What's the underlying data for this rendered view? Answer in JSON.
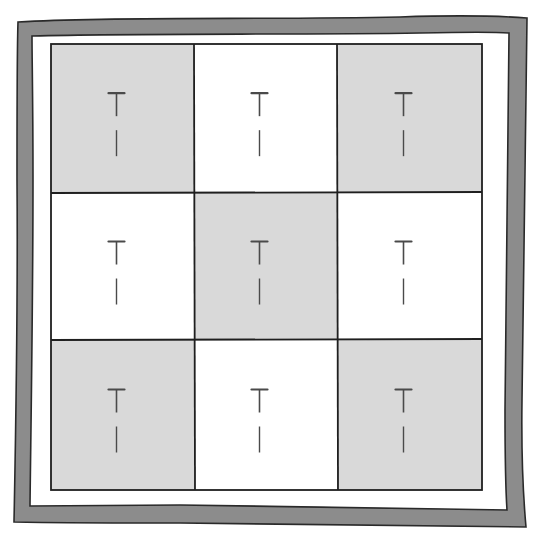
{
  "illustration": {
    "subject": "Framed 3x3 checkerboard of squares, each with a T-pin",
    "colors": {
      "background": "#ffffff",
      "frame_fill": "#8c8c8c",
      "frame_stroke": "#2a2a2a",
      "shaded_square": "#d9d9d9",
      "white_square": "#ffffff",
      "grid_line": "#1f1f1f",
      "pin": "#4a4a4a"
    },
    "grid": {
      "rows": 3,
      "cols": 3,
      "cells": [
        {
          "row": 0,
          "col": 0,
          "shade": "shaded",
          "has_pin": true
        },
        {
          "row": 0,
          "col": 1,
          "shade": "white",
          "has_pin": true
        },
        {
          "row": 0,
          "col": 2,
          "shade": "shaded",
          "has_pin": true
        },
        {
          "row": 1,
          "col": 0,
          "shade": "white",
          "has_pin": true
        },
        {
          "row": 1,
          "col": 1,
          "shade": "shaded",
          "has_pin": true
        },
        {
          "row": 1,
          "col": 2,
          "shade": "white",
          "has_pin": true
        },
        {
          "row": 2,
          "col": 0,
          "shade": "shaded",
          "has_pin": true
        },
        {
          "row": 2,
          "col": 1,
          "shade": "white",
          "has_pin": true
        },
        {
          "row": 2,
          "col": 2,
          "shade": "shaded",
          "has_pin": true
        }
      ]
    }
  }
}
